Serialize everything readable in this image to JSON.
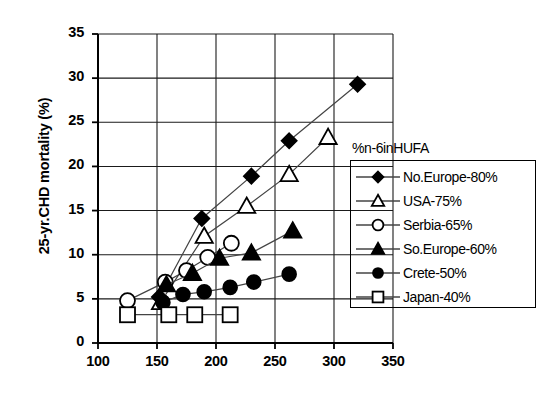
{
  "chart_data": {
    "type": "scatter",
    "title": "",
    "xlabel": "",
    "ylabel": "25-yr.CHD mortality (%)",
    "xlim": [
      100,
      350
    ],
    "ylim": [
      0,
      35
    ],
    "xticks": [
      100,
      150,
      200,
      250,
      300,
      350
    ],
    "yticks": [
      0,
      5,
      10,
      15,
      20,
      25,
      30,
      35
    ],
    "grid": true,
    "legend_position": "right",
    "legend_title": "%n-6inHUFA",
    "series": [
      {
        "name": "No.Europe-80%",
        "marker": "filled-diamond",
        "color": "#000000",
        "points": [
          [
            152,
            5.2
          ],
          [
            188,
            14.1
          ],
          [
            230,
            18.9
          ],
          [
            262,
            22.9
          ],
          [
            320,
            29.3
          ]
        ]
      },
      {
        "name": "USA-75%",
        "marker": "open-triangle",
        "color": "#000000",
        "points": [
          [
            153,
            4.6
          ],
          [
            190,
            12.1
          ],
          [
            226,
            15.5
          ],
          [
            262,
            19.1
          ],
          [
            295,
            23.3
          ]
        ]
      },
      {
        "name": "Serbia-65%",
        "marker": "open-circle",
        "color": "#000000",
        "points": [
          [
            125,
            4.8
          ],
          [
            157,
            6.9
          ],
          [
            175,
            8.2
          ],
          [
            193,
            9.7
          ],
          [
            213,
            11.3
          ]
        ]
      },
      {
        "name": "So.Europe-60%",
        "marker": "filled-triangle",
        "color": "#000000",
        "points": [
          [
            158,
            6.6
          ],
          [
            180,
            7.9
          ],
          [
            203,
            9.6
          ],
          [
            230,
            10.2
          ],
          [
            265,
            12.7
          ]
        ]
      },
      {
        "name": "Crete-50%",
        "marker": "filled-circle",
        "color": "#000000",
        "points": [
          [
            155,
            4.6
          ],
          [
            172,
            5.5
          ],
          [
            190,
            5.8
          ],
          [
            212,
            6.3
          ],
          [
            232,
            6.9
          ],
          [
            262,
            7.8
          ]
        ]
      },
      {
        "name": "Japan-40%",
        "marker": "open-square",
        "color": "#000000",
        "points": [
          [
            125,
            3.2
          ],
          [
            160,
            3.2
          ],
          [
            182,
            3.2
          ],
          [
            212,
            3.2
          ]
        ]
      }
    ]
  },
  "axis": {
    "ylabel": "25-yr.CHD mortality (%)",
    "ytick_labels": [
      "0",
      "5",
      "10",
      "15",
      "20",
      "25",
      "30",
      "35"
    ],
    "xtick_labels": [
      "100",
      "150",
      "200",
      "250",
      "300",
      "350"
    ]
  },
  "legend": {
    "title": "%n-6inHUFA",
    "items": [
      {
        "label": "No.Europe-80%",
        "marker": "filled-diamond"
      },
      {
        "label": "USA-75%",
        "marker": "open-triangle"
      },
      {
        "label": "Serbia-65%",
        "marker": "open-circle"
      },
      {
        "label": "So.Europe-60%",
        "marker": "filled-triangle"
      },
      {
        "label": "Crete-50%",
        "marker": "filled-circle"
      },
      {
        "label": "Japan-40%",
        "marker": "open-square"
      }
    ]
  }
}
